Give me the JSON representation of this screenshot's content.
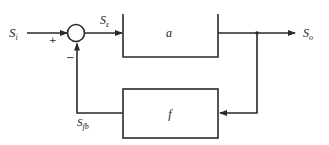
{
  "diagram": {
    "type": "feedback-block-diagram",
    "colors": {
      "stroke": "#2a2a2a",
      "background": "#ffffff",
      "text": "#222222"
    },
    "signals": {
      "input": {
        "symbol": "S",
        "subscript": "i"
      },
      "error": {
        "symbol": "S",
        "subscript": "ε"
      },
      "output": {
        "symbol": "S",
        "subscript": "o"
      },
      "feedback": {
        "symbol": "S",
        "subscript": "fb"
      }
    },
    "summing_junction": {
      "plus_sign": "+",
      "minus_sign": "−"
    },
    "blocks": {
      "forward": {
        "label": "a"
      },
      "feedback": {
        "label": "f"
      }
    }
  }
}
